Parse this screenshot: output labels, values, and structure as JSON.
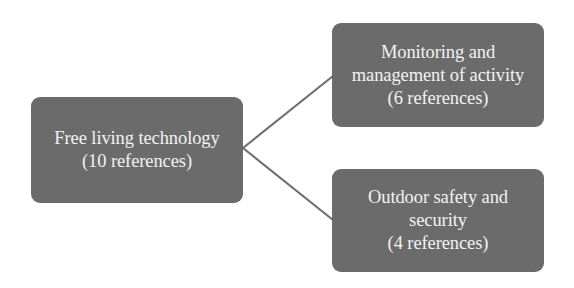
{
  "diagram": {
    "type": "tree",
    "colors": {
      "node_fill": "#6b6b6b",
      "node_text": "#f2f2f2",
      "connector": "#707070",
      "background": "#ffffff"
    },
    "root": {
      "id": "free-living-technology",
      "lines": [
        "Free living technology",
        "(10 references)"
      ],
      "title": "Free living technology",
      "references": 10
    },
    "children": [
      {
        "id": "monitoring-management",
        "lines": [
          "Monitoring and",
          "management of activity",
          "(6 references)"
        ],
        "title": "Monitoring and management of activity",
        "references": 6
      },
      {
        "id": "outdoor-safety-security",
        "lines": [
          "Outdoor safety and",
          "security",
          "(4 references)"
        ],
        "title": "Outdoor safety and security",
        "references": 4
      }
    ],
    "edges": [
      {
        "from": "free-living-technology",
        "to": "monitoring-management"
      },
      {
        "from": "free-living-technology",
        "to": "outdoor-safety-security"
      }
    ]
  }
}
